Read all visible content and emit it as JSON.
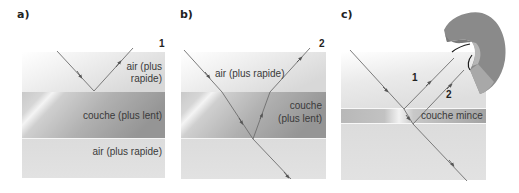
{
  "panels": [
    {
      "id": "a",
      "label": "a)",
      "ray_number": "1",
      "top_medium": [
        "air (plus",
        "rapide)"
      ],
      "layer": "couche (plus lent)",
      "bottom_medium": "air (plus rapide)"
    },
    {
      "id": "b",
      "label": "b)",
      "ray_number": "2",
      "top_medium": "air (plus rapide)",
      "layer": [
        "couche",
        "(plus lent)"
      ]
    },
    {
      "id": "c",
      "label": "c)",
      "ray_1": "1",
      "ray_2": "2",
      "layer": "couche mince"
    }
  ],
  "colors": {
    "air_top": "#e6e6e6",
    "layer_dark": "#9a9a9a",
    "layer_light": "#cfcfcf",
    "air_bottom": "#d9d9d9",
    "ray": "#6e6e6e",
    "eye": "#8f8f8f"
  }
}
